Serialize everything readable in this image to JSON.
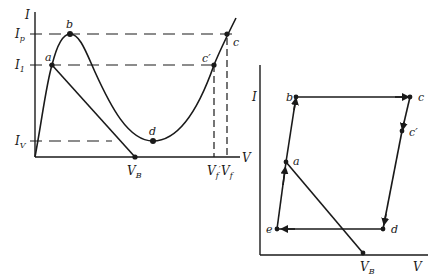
{
  "left_plot": {
    "axis_labels": {
      "y": "I",
      "x": "V"
    },
    "y_levels": [
      {
        "id": "Ip",
        "main": "I",
        "sub": "p"
      },
      {
        "id": "I1",
        "main": "I",
        "sub": "1"
      },
      {
        "id": "IV",
        "main": "I",
        "sub": "V"
      }
    ],
    "x_marks": [
      {
        "id": "VB",
        "main": "V",
        "sub": "B"
      },
      {
        "id": "Vf_prime",
        "main": "V",
        "sub": "f",
        "prime": "′"
      },
      {
        "id": "Vf",
        "main": "V",
        "sub": "f"
      }
    ],
    "points": {
      "a": "a",
      "b": "b",
      "c": "c",
      "c_prime": "c′",
      "d": "d"
    }
  },
  "right_plot": {
    "axis_labels": {
      "y": "I",
      "x": "V"
    },
    "points": {
      "a": "a",
      "b": "b",
      "c": "c",
      "c_prime": "c′",
      "d": "d",
      "e": "e"
    },
    "x_marks": [
      {
        "id": "VB",
        "main": "V",
        "sub": "B"
      }
    ],
    "cycle": [
      "a",
      "b",
      "c",
      "c′",
      "d",
      "e",
      "a"
    ]
  }
}
